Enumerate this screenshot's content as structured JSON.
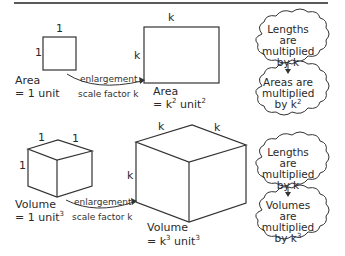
{
  "area_section": {
    "small_square": {
      "side_top": "1",
      "side_left": "1",
      "label_line1": "Area",
      "label_line2": "= 1 unit"
    },
    "arrow": {
      "line1": "enlargement",
      "line2": "scale factor k"
    },
    "large_square": {
      "side_top": "k",
      "side_left": "k",
      "label_line1": "Area",
      "label_line2_prefix": "= k",
      "label_line2_exp": "2",
      "label_line2_unit": " unit",
      "label_line2_unit_exp": "2"
    },
    "cloud_top": {
      "line1": "Lengths are",
      "line2": "multiplied",
      "line3": "by k"
    },
    "cloud_bottom": {
      "line1": "Areas are",
      "line2": "multiplied",
      "line3_prefix": "by k",
      "line3_exp": "2"
    }
  },
  "volume_section": {
    "small_cube": {
      "edge_top_left": "1",
      "edge_top_right": "1",
      "edge_left": "1",
      "label_line1": "Volume",
      "label_line2_prefix": "= 1 unit",
      "label_line2_exp": "3"
    },
    "arrow": {
      "line1": "enlargement",
      "line2": "scale factor k"
    },
    "large_cube": {
      "edge_top_left": "k",
      "edge_top_right": "k",
      "edge_left": "k",
      "label_line1": "Volume",
      "label_line2_prefix": "= k",
      "label_line2_exp": "3",
      "label_line2_unit": " unit",
      "label_line2_unit_exp": "3"
    },
    "cloud_top": {
      "line1": "Lengths are",
      "line2": "multiplied",
      "line3": "by k"
    },
    "cloud_bottom": {
      "line1": "Volumes are",
      "line2": "multiplied",
      "line3_prefix": "by k",
      "line3_exp": "3"
    }
  }
}
